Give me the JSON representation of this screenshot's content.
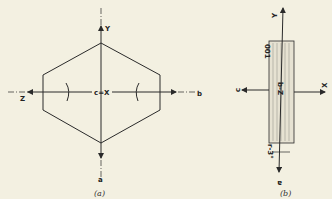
{
  "figure_a": {
    "caption": "(a)",
    "labels": {
      "top": "Y",
      "bottom": "a",
      "left": "Z",
      "right": "b",
      "center": "c=X"
    }
  },
  "figure_b": {
    "caption": "(b)",
    "labels": {
      "top": "Y",
      "bottom": "a",
      "left": "c",
      "right": "X",
      "center": "b-Z",
      "face": "001",
      "angle": "r-3°"
    }
  },
  "colors": {
    "background": "#f3f0e1",
    "line": "#2a2a2a",
    "hatch": "#8a8a80"
  }
}
